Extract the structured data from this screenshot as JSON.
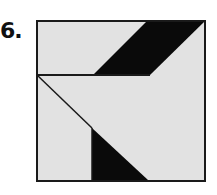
{
  "figure": {
    "number_label": "6.",
    "colors": {
      "fill_light": "#e2e2e2",
      "fill_dark": "#0a0a0a",
      "stroke": "#1a1a1a",
      "background": "#ffffff"
    },
    "square": {
      "x": 37,
      "y": 21,
      "w": 168,
      "h": 160
    },
    "shapes": [
      {
        "name": "top-dark-band",
        "points": "146,22 204,22 150,75 93,75"
      },
      {
        "name": "bottom-dark-triangle",
        "points": "92,128 92,180 148,180"
      }
    ],
    "lines": [
      {
        "name": "horizontal-divider",
        "x1": 37,
        "y1": 75,
        "x2": 150,
        "y2": 75
      },
      {
        "name": "diagonal-line",
        "x1": 37,
        "y1": 75,
        "x2": 92,
        "y2": 128
      },
      {
        "name": "vertical-line",
        "x1": 92,
        "y1": 128,
        "x2": 92,
        "y2": 181
      }
    ]
  }
}
